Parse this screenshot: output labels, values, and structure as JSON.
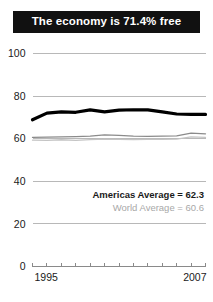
{
  "title": {
    "text": "The economy is 71.4% free"
  },
  "legend": {
    "americas": "Americas Average = 62.3",
    "world": "World Average = 60.6"
  },
  "chart_data": {
    "type": "line",
    "title": "The economy is 71.4% free",
    "xlabel": "",
    "ylabel": "",
    "ylim": [
      0,
      100
    ],
    "xlim": [
      1995,
      2007
    ],
    "yticks": [
      0,
      20,
      40,
      60,
      80,
      100
    ],
    "xticks": [
      1995,
      1996,
      1997,
      1998,
      1999,
      2000,
      2001,
      2002,
      2003,
      2004,
      2005,
      2006,
      2007
    ],
    "xtick_labels_shown": [
      "1995",
      "2007"
    ],
    "grid": true,
    "legend_position": "inside-right",
    "x": [
      1995,
      1996,
      1997,
      1998,
      1999,
      2000,
      2001,
      2002,
      2003,
      2004,
      2005,
      2006,
      2007
    ],
    "series": [
      {
        "name": "Country score",
        "color": "#000000",
        "style": "bold",
        "values": [
          68.9,
          72.0,
          72.6,
          72.4,
          73.5,
          72.6,
          73.4,
          73.6,
          73.5,
          72.6,
          71.6,
          71.4,
          71.4
        ]
      },
      {
        "name": "Americas Average",
        "color": "#8b8b8b",
        "style": "thin",
        "values": [
          60.6,
          60.7,
          60.9,
          61.0,
          61.2,
          61.8,
          61.6,
          61.2,
          61.1,
          61.2,
          61.3,
          62.6,
          62.3
        ]
      },
      {
        "name": "World Average",
        "color": "#c4c4c4",
        "style": "thin",
        "values": [
          59.3,
          59.2,
          59.5,
          59.2,
          59.6,
          59.8,
          59.7,
          59.6,
          59.7,
          59.7,
          59.8,
          60.9,
          60.6
        ]
      }
    ],
    "annotations": [
      "Americas Average = 62.3",
      "World Average = 60.6"
    ]
  }
}
